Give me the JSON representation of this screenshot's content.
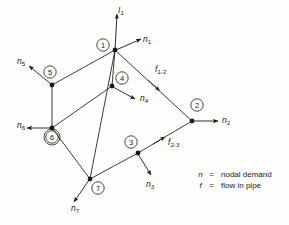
{
  "figure": {
    "type": "network-diagram",
    "background_color": "#fdfdfc",
    "line_color": "#1a1a1a"
  },
  "inflow": {
    "label_base": "I",
    "label_sub": "1",
    "description": "inflow arrow into node 1"
  },
  "nodes": [
    {
      "id": "1",
      "label": "1",
      "circle_x": 103,
      "circle_y": 45,
      "dot_x": 115,
      "dot_y": 50
    },
    {
      "id": "2",
      "label": "2",
      "circle_x": 197,
      "circle_y": 105,
      "dot_x": 192,
      "dot_y": 121
    },
    {
      "id": "3",
      "label": "3",
      "circle_x": 131,
      "circle_y": 142,
      "dot_x": 138,
      "dot_y": 153
    },
    {
      "id": "4",
      "label": "4",
      "circle_x": 122,
      "circle_y": 78,
      "dot_x": 112,
      "dot_y": 86
    },
    {
      "id": "5",
      "label": "5",
      "circle_x": 50,
      "circle_y": 72,
      "dot_x": 52,
      "dot_y": 85
    },
    {
      "id": "6",
      "label": "6",
      "circle_x": 52,
      "circle_y": 137,
      "dot_x": 52,
      "dot_y": 128
    },
    {
      "id": "7",
      "label": "7",
      "circle_x": 98,
      "circle_y": 188,
      "dot_x": 90,
      "dot_y": 179
    }
  ],
  "demand_arrows": [
    {
      "name": "n1",
      "base": "n",
      "sub": "1",
      "label_x": 143,
      "label_y": 35
    },
    {
      "name": "n2",
      "base": "n",
      "sub": "2",
      "label_x": 222,
      "label_y": 116
    },
    {
      "name": "n3",
      "base": "n",
      "sub": "3",
      "label_x": 146,
      "label_y": 180
    },
    {
      "name": "n4",
      "base": "n",
      "sub": "4",
      "label_x": 140,
      "label_y": 94
    },
    {
      "name": "n5",
      "base": "n",
      "sub": "5",
      "label_x": 17,
      "label_y": 60
    },
    {
      "name": "n6",
      "base": "n",
      "sub": "6",
      "label_x": 17,
      "label_y": 123
    },
    {
      "name": "n7",
      "base": "n",
      "sub": "7",
      "label_x": 71,
      "label_y": 205
    }
  ],
  "flow_labels": [
    {
      "name": "f1-2",
      "base": "f",
      "sub": "1-2",
      "label_x": 155,
      "label_y": 68
    },
    {
      "name": "f2-3",
      "base": "f",
      "sub": "2-3",
      "label_x": 168,
      "label_y": 140
    }
  ],
  "legend": {
    "rows": [
      {
        "symbol": "n",
        "equals": "=",
        "text": "nodal demand"
      },
      {
        "symbol": "f",
        "equals": "=",
        "text": "flow in pipe"
      }
    ]
  }
}
